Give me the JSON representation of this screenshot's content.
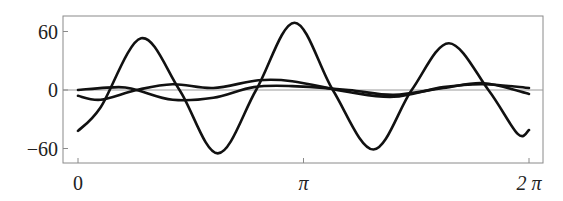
{
  "chart_data": {
    "type": "line",
    "title": "",
    "xlabel": "",
    "ylabel": "",
    "xlim": [
      0,
      6.2832
    ],
    "ylim": [
      -75,
      76
    ],
    "grid": false,
    "legend": null,
    "x_ticks": [
      {
        "value": 0,
        "label": "0"
      },
      {
        "value": 3.1416,
        "label": "π"
      },
      {
        "value": 6.2832,
        "label": "2 π"
      }
    ],
    "y_ticks": [
      {
        "value": 60,
        "label": "60"
      },
      {
        "value": 0,
        "label": "0"
      },
      {
        "value": -60,
        "label": "−60"
      }
    ],
    "reference_line": {
      "y": 0,
      "color": "#9a9a9a"
    },
    "series": [
      {
        "name": "large-oscillation",
        "color": "#111111",
        "x": [
          0.0,
          0.1,
          0.28,
          0.45,
          0.62,
          0.79,
          0.96,
          1.13,
          1.31,
          1.48,
          1.645,
          1.82,
          1.95,
          2.0
        ],
        "x_unit": "pi",
        "y": [
          -42,
          -18,
          53,
          0,
          -65,
          0,
          69,
          0,
          -61,
          0,
          48,
          0,
          -45,
          -41
        ]
      },
      {
        "name": "small-oscillation-a",
        "color": "#111111",
        "x": [
          0.0,
          0.18,
          0.26,
          0.42,
          0.6,
          0.78,
          0.95,
          1.2,
          1.4,
          1.62,
          1.8,
          2.0
        ],
        "x_unit": "pi",
        "y": [
          0,
          3,
          0,
          -10,
          -8,
          3,
          4,
          0,
          -5,
          2,
          7,
          -4
        ]
      },
      {
        "name": "small-oscillation-b",
        "color": "#111111",
        "x": [
          0.0,
          0.1,
          0.26,
          0.42,
          0.6,
          0.8,
          0.95,
          1.2,
          1.4,
          1.62,
          1.8,
          2.0
        ],
        "x_unit": "pi",
        "y": [
          -6,
          -10,
          0,
          6,
          2,
          10,
          9,
          -2,
          -7,
          3,
          6,
          2
        ]
      }
    ]
  },
  "layout": {
    "frame": {
      "left": 63,
      "top": 16,
      "right": 543,
      "bottom": 163
    },
    "x_pixel": {
      "zero": 78,
      "two_pi": 529
    },
    "y_pixel": {
      "v60": 32,
      "v0": 90,
      "vneg60": 149
    }
  }
}
